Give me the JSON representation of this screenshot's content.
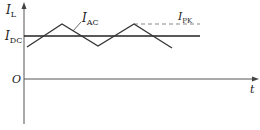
{
  "diagram": {
    "axes": {
      "y_label": "I",
      "y_label_sub": "L",
      "x_label": "t",
      "origin_label": "O"
    },
    "labels": {
      "dc": {
        "main": "I",
        "sub": "DC"
      },
      "ac": {
        "main": "I",
        "sub": "AC"
      },
      "pk": {
        "main": "I",
        "sub": "PK"
      }
    },
    "colors": {
      "line": "#333333",
      "dashed": "#888888"
    }
  }
}
